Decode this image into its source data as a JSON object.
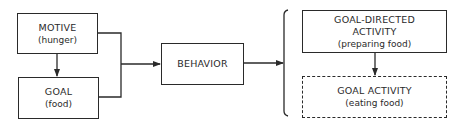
{
  "diagram": {
    "nodes": {
      "motive": {
        "title": "MOTIVE",
        "subtitle": "(hunger)"
      },
      "goal": {
        "title": "GOAL",
        "subtitle": "(food)"
      },
      "behavior": {
        "title": "BEHAVIOR"
      },
      "goal_directed_activity": {
        "title_line1": "GOAL-DIRECTED",
        "title_line2": "ACTIVITY",
        "subtitle": "(preparing food)"
      },
      "goal_activity": {
        "title": "GOAL ACTIVITY",
        "subtitle": "(eating food)",
        "style": "dashed"
      }
    },
    "edges": [
      {
        "from": "motive",
        "to": "goal"
      },
      {
        "from": "motive",
        "to": "behavior"
      },
      {
        "from": "goal",
        "to": "behavior"
      },
      {
        "from": "behavior",
        "to": "bracket(goal_directed_activity, goal_activity)"
      },
      {
        "from": "goal_directed_activity",
        "to": "goal_activity"
      }
    ],
    "colors": {
      "stroke": "#2a2a2a",
      "background": "#ffffff"
    }
  }
}
